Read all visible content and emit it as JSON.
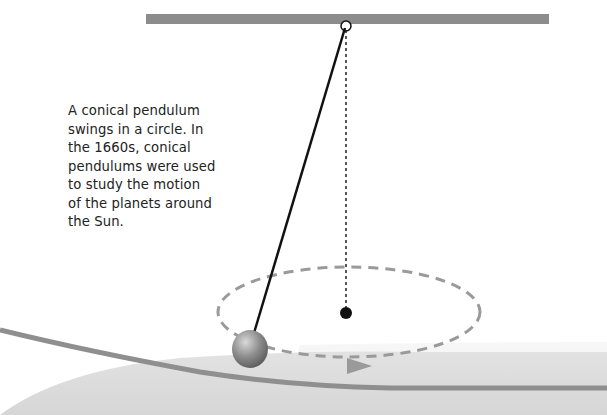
{
  "caption": {
    "lines": [
      "A conical pendulum",
      "swings in a circle. In",
      "the 1660s, conical",
      "pendulums were used",
      "to study the motion",
      "of the planets around",
      "the Sun."
    ]
  },
  "diagram": {
    "support_bar": {
      "color": "#8c8c8c"
    },
    "string": {
      "color": "#111111"
    },
    "vertical_axis": {
      "style": "dotted",
      "color": "#222222"
    },
    "center_point": {
      "color": "#111111"
    },
    "orbit_path": {
      "style": "dashed",
      "color": "#9a9a9a"
    },
    "direction_arrow": {
      "color": "#9a9a9a"
    },
    "bob": {
      "color": "#8a8a8a"
    },
    "floor": {
      "color": "#dedede",
      "edge_color": "#8f8f8f"
    }
  }
}
